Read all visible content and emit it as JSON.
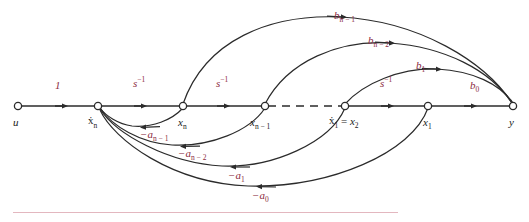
{
  "figure": {
    "type": "signal-flow-graph",
    "background_color": "#ffffff",
    "line_color": "#2b2b2b",
    "gain_label_color": "#8c2b41",
    "node_label_color": "#1b1b1b",
    "rule_color": "#e3b7bf"
  },
  "nodes": [
    {
      "id": "u",
      "label": "u",
      "x": 18,
      "y": 106
    },
    {
      "id": "xdn",
      "label": "ẋn",
      "x": 98,
      "y": 106
    },
    {
      "id": "xn",
      "label": "xn",
      "x": 183,
      "y": 106
    },
    {
      "id": "xn1",
      "label": "xn-1",
      "x": 265,
      "y": 106
    },
    {
      "id": "xd1",
      "label": "ẋ1 = x2",
      "x": 345,
      "y": 106
    },
    {
      "id": "x1",
      "label": "x1",
      "x": 428,
      "y": 106
    },
    {
      "id": "y",
      "label": "y",
      "x": 513,
      "y": 106
    }
  ],
  "node_labels": [
    {
      "id": "u",
      "base": "u",
      "sub": "",
      "dot": false,
      "eq": "",
      "x": 13,
      "y": 117
    },
    {
      "id": "xdn",
      "base": "x",
      "sub": "n",
      "dot": true,
      "eq": "",
      "x": 89,
      "y": 117
    },
    {
      "id": "xn",
      "base": "x",
      "sub": "n",
      "dot": false,
      "eq": "",
      "x": 178,
      "y": 117
    },
    {
      "id": "xn1",
      "base": "x",
      "sub": "n − 1",
      "dot": false,
      "eq": "",
      "x": 251,
      "y": 117
    },
    {
      "id": "xd1",
      "base": "x",
      "sub": "1",
      "dot": true,
      "eq": " = x",
      "x": 330,
      "y": 117
    },
    {
      "id": "x1",
      "base": "x",
      "sub": "1",
      "dot": false,
      "eq": "",
      "x": 423,
      "y": 117
    },
    {
      "id": "y",
      "base": "y",
      "sub": "",
      "dot": false,
      "eq": "",
      "x": 509,
      "y": 117
    }
  ],
  "forward_path": {
    "segments": [
      {
        "from": "u",
        "to": "xdn",
        "gain": "1",
        "style": "solid",
        "arrow": true
      },
      {
        "from": "xdn",
        "to": "xn",
        "gain": "s-1",
        "style": "solid",
        "arrow": true
      },
      {
        "from": "xn",
        "to": "xn1",
        "gain": "s-1",
        "style": "solid",
        "arrow": true
      },
      {
        "from": "xn1",
        "to": "xd1",
        "gain": "",
        "style": "dashed",
        "arrow": false
      },
      {
        "from": "xd1",
        "to": "x1",
        "gain": "s-1",
        "style": "solid",
        "arrow": true
      },
      {
        "from": "x1",
        "to": "y",
        "gain": "b0",
        "style": "solid",
        "arrow": true
      }
    ]
  },
  "gain_labels": [
    {
      "id": "g-one",
      "base": "1",
      "sup": "",
      "sub": "",
      "x": 55,
      "y": 80
    },
    {
      "id": "g-sinv-1",
      "base": "s",
      "sup": "-1",
      "sub": "",
      "x": 133,
      "y": 80
    },
    {
      "id": "g-sinv-2",
      "base": "s",
      "sup": "-1",
      "sub": "",
      "x": 216,
      "y": 80
    },
    {
      "id": "g-sinv-3",
      "base": "s",
      "sup": "-1",
      "sub": "",
      "x": 380,
      "y": 80
    },
    {
      "id": "g-b0",
      "base": "b",
      "sup": "",
      "sub": "0",
      "x": 470,
      "y": 80
    },
    {
      "id": "g-bn1",
      "base": "b",
      "sup": "",
      "sub": "n − 1",
      "x": 334,
      "y": 10
    },
    {
      "id": "g-bn2",
      "base": "b",
      "sup": "",
      "sub": "n − 2",
      "x": 368,
      "y": 35
    },
    {
      "id": "g-b1",
      "base": "b",
      "sup": "",
      "sub": "1",
      "x": 416,
      "y": 60
    },
    {
      "id": "g-an1",
      "base": "−a",
      "sup": "",
      "sub": "n − 1",
      "x": 140,
      "y": 129
    },
    {
      "id": "g-an2",
      "base": "−a",
      "sup": "",
      "sub": "n − 2",
      "x": 178,
      "y": 148
    },
    {
      "id": "g-a1",
      "base": "−a",
      "sup": "",
      "sub": "1",
      "x": 228,
      "y": 170
    },
    {
      "id": "g-a0",
      "base": "−a",
      "sup": "",
      "sub": "0",
      "x": 252,
      "y": 190
    }
  ],
  "feedforward_arcs": [
    {
      "id": "arc-bn1",
      "gain": "bn-1",
      "from": "xn",
      "to": "y",
      "direction": "right"
    },
    {
      "id": "arc-bn2",
      "gain": "bn-2",
      "from": "xn1",
      "to": "y",
      "direction": "right"
    },
    {
      "id": "arc-b1",
      "gain": "b1",
      "from": "xd1",
      "to": "y",
      "direction": "right"
    }
  ],
  "feedback_arcs": [
    {
      "id": "arc-an1",
      "gain": "-an-1",
      "from": "xn",
      "to": "xdn",
      "direction": "left"
    },
    {
      "id": "arc-an2",
      "gain": "-an-2",
      "from": "xn1",
      "to": "xdn",
      "direction": "left"
    },
    {
      "id": "arc-a1",
      "gain": "-a1",
      "from": "xd1",
      "to": "xdn",
      "direction": "left"
    },
    {
      "id": "arc-a0",
      "gain": "-a0",
      "from": "x1",
      "to": "xdn",
      "direction": "left"
    }
  ]
}
